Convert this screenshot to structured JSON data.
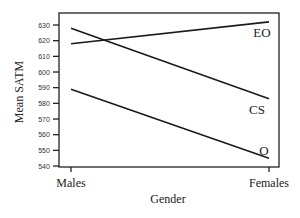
{
  "chart_data": {
    "type": "line",
    "title": "",
    "xlabel": "Gender",
    "ylabel": "Mean SATM",
    "categories": [
      "Males",
      "Females"
    ],
    "series": [
      {
        "name": "EO",
        "values": [
          618,
          632
        ]
      },
      {
        "name": "CS",
        "values": [
          628,
          583
        ]
      },
      {
        "name": "O",
        "values": [
          589,
          545
        ]
      }
    ],
    "yticks": [
      540,
      550,
      560,
      570,
      580,
      590,
      600,
      610,
      620,
      630
    ],
    "ylim": [
      539,
      638
    ],
    "grid": false,
    "legend": "inline labels at right end of lines"
  },
  "labels": {
    "xlabel": "Gender",
    "ylabel": "Mean SATM",
    "cat0": "Males",
    "cat1": "Females",
    "s0": "EO",
    "s1": "CS",
    "s2": "O"
  }
}
